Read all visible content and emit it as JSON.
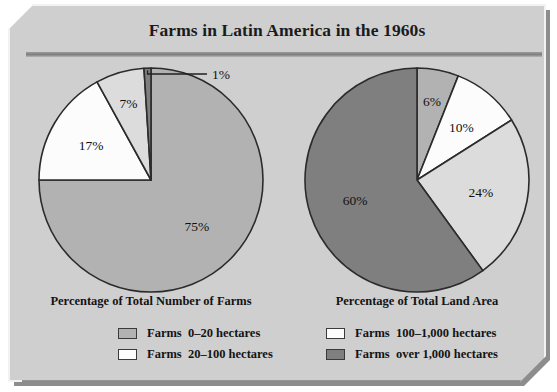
{
  "figure": {
    "title": "Farms in Latin America in the 1960s",
    "panel_color": "#cfcfcf",
    "rule_color": "#7e7e7e"
  },
  "palette": {
    "medium_gray": "#b2b2b2",
    "white": "#fcfcfc",
    "light_gray": "#dcdcdc",
    "dark_gray": "#7f7f7f",
    "outline": "#2b2b2b"
  },
  "legend": {
    "items": [
      {
        "label": "Farms  0–20 hectares",
        "color": "#b2b2b2",
        "column": "left",
        "row": 0
      },
      {
        "label": "Farms  20–100 hectares",
        "color": "#fcfcfc",
        "column": "left",
        "row": 1
      },
      {
        "label": "Farms  100–1,000 hectares",
        "color": "#fcfcfc",
        "column": "right",
        "row": 0
      },
      {
        "label": "Farms  over 1,000 hectares",
        "color": "#7f7f7f",
        "column": "right",
        "row": 1
      }
    ]
  },
  "chart_data": [
    {
      "type": "pie",
      "title": "Percentage of Total Number of Farms",
      "categories": [
        "Farms 0–20 hectares",
        "Farms 20–100 hectares",
        "Farms 100–1,000 hectares",
        "Farms over 1,000 hectares"
      ],
      "values": [
        75,
        17,
        7,
        1
      ],
      "labels": [
        "75%",
        "17%",
        "7%",
        "1%"
      ],
      "colors": [
        "#b2b2b2",
        "#fcfcfc",
        "#dcdcdc",
        "#7f7f7f"
      ],
      "start_angle_deg": 0,
      "direction": "clockwise",
      "callout_slices": [
        "1%"
      ],
      "legend_position": "bottom"
    },
    {
      "type": "pie",
      "title": "Percentage of Total Land Area",
      "categories": [
        "Farms 0–20 hectares",
        "Farms 20–100 hectares",
        "Farms 100–1,000 hectares",
        "Farms over 1,000 hectares"
      ],
      "values": [
        6,
        10,
        24,
        60
      ],
      "labels": [
        "6%",
        "10%",
        "24%",
        "60%"
      ],
      "colors": [
        "#b2b2b2",
        "#fcfcfc",
        "#dcdcdc",
        "#7f7f7f"
      ],
      "start_angle_deg": 0,
      "direction": "clockwise",
      "callout_slices": [],
      "legend_position": "bottom"
    }
  ]
}
